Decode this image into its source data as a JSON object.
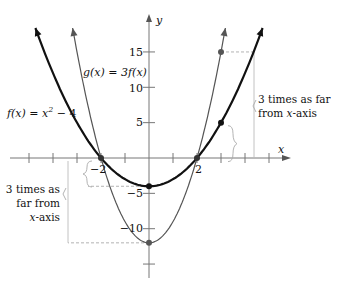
{
  "axes": {
    "x_label": "x",
    "y_label": "y",
    "x_range": [
      -6,
      7
    ],
    "y_range": [
      -17,
      20
    ],
    "x_ticks": [
      -5,
      -4,
      -3,
      -2,
      -1,
      1,
      2,
      3,
      4,
      5
    ],
    "y_ticks": [
      -15,
      -10,
      -5,
      5,
      10,
      15
    ],
    "x_tick_labels": [
      {
        "value": -2,
        "text": "−2"
      },
      {
        "value": 2,
        "text": "2"
      }
    ],
    "y_tick_labels": [
      {
        "value": 15,
        "text": "15"
      },
      {
        "value": 10,
        "text": "10"
      },
      {
        "value": 5,
        "text": "5"
      },
      {
        "value": -5,
        "text": "−5"
      },
      {
        "value": -10,
        "text": "−10"
      }
    ]
  },
  "functions": [
    {
      "name": "f",
      "label_text": "f(x) = x",
      "label_sup": "2",
      "label_tail": " − 4",
      "expression": "x^2 - 4",
      "color": "#111111",
      "width": 2.2
    },
    {
      "name": "g",
      "label_text": "g(x) = 3f(x)",
      "expression": "3(x^2 - 4)",
      "color": "#555555",
      "width": 1.2
    }
  ],
  "points": [
    {
      "curve": "f",
      "x": 0,
      "y": -4,
      "color": "#111111"
    },
    {
      "curve": "g",
      "x": 0,
      "y": -12,
      "color": "#555555"
    },
    {
      "curve": "f",
      "x": 3,
      "y": 5,
      "color": "#111111"
    },
    {
      "curve": "g",
      "x": 3,
      "y": 15,
      "color": "#555555"
    },
    {
      "curve": "both",
      "x": -2,
      "y": 0,
      "color": "#333333"
    },
    {
      "curve": "both",
      "x": 2,
      "y": 0,
      "color": "#333333"
    }
  ],
  "annotations": {
    "right": {
      "line1": "3 times as far",
      "line2": "from ",
      "line2_italic": "x",
      "line2_tail": "-axis"
    },
    "left": {
      "line1": "3 times as",
      "line2": "far from",
      "line3_italic": "x",
      "line3_tail": "-axis"
    }
  },
  "chart_data": {
    "type": "line",
    "title": "",
    "xlabel": "x",
    "ylabel": "y",
    "series": [
      {
        "name": "f(x) = x^2 - 4",
        "points": [
          [
            -4.5,
            16.25
          ],
          [
            -3,
            5
          ],
          [
            -2,
            0
          ],
          [
            0,
            -4
          ],
          [
            2,
            0
          ],
          [
            3,
            5
          ],
          [
            4.5,
            16.25
          ]
        ]
      },
      {
        "name": "g(x) = 3f(x)",
        "points": [
          [
            -3.0,
            15
          ],
          [
            -2,
            0
          ],
          [
            0,
            -12
          ],
          [
            2,
            0
          ],
          [
            3,
            15
          ]
        ]
      }
    ],
    "highlighted_points": [
      [
        0,
        -4
      ],
      [
        0,
        -12
      ],
      [
        3,
        5
      ],
      [
        3,
        15
      ],
      [
        -2,
        0
      ],
      [
        2,
        0
      ]
    ],
    "xlim": [
      -6,
      7
    ],
    "ylim": [
      -17,
      20
    ],
    "grid": false
  }
}
